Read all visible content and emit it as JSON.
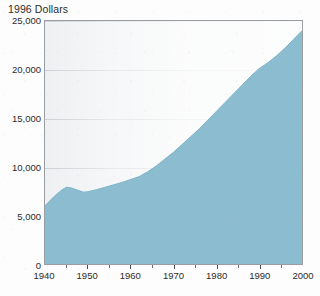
{
  "chart_data": {
    "type": "area",
    "title": "1996 Dollars",
    "xlabel": "",
    "ylabel": "1996 Dollars",
    "xlim": [
      1940,
      2000
    ],
    "ylim": [
      0,
      25000
    ],
    "grid": true,
    "legend": "none",
    "series_color": "#8cbcd0",
    "x": [
      1940,
      1942,
      1944,
      1945,
      1946,
      1947,
      1948,
      1949,
      1950,
      1952,
      1954,
      1956,
      1958,
      1960,
      1962,
      1964,
      1966,
      1968,
      1970,
      1972,
      1974,
      1976,
      1978,
      1980,
      1982,
      1984,
      1986,
      1988,
      1990,
      1992,
      1994,
      1996,
      1998,
      2000
    ],
    "values": [
      6000,
      6900,
      7650,
      7900,
      7850,
      7700,
      7550,
      7400,
      7450,
      7650,
      7900,
      8150,
      8400,
      8700,
      9000,
      9500,
      10100,
      10800,
      11500,
      12300,
      13100,
      13900,
      14800,
      15700,
      16600,
      17500,
      18400,
      19300,
      20100,
      20700,
      21400,
      22200,
      23100,
      24000
    ],
    "ytick_labels": [
      "0",
      "5,000",
      "10,000",
      "15,000",
      "20,000",
      "25,000"
    ],
    "ytick_values": [
      0,
      5000,
      10000,
      15000,
      20000,
      25000
    ],
    "xtick_labels": [
      "1940",
      "1950",
      "1960",
      "1970",
      "1980",
      "1990",
      "2000"
    ],
    "xtick_values": [
      1940,
      1950,
      1960,
      1970,
      1980,
      1990,
      2000
    ],
    "xtick_minor_values": [
      1945,
      1955,
      1965,
      1975,
      1985,
      1995
    ]
  }
}
